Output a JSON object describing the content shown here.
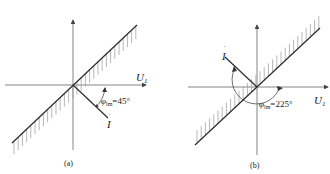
{
  "figures": [
    {
      "id": "a",
      "caption": "(a)",
      "axis_label": "U",
      "axis_label_sub": "1",
      "current_label": "I",
      "angle_symbol": "φ",
      "angle_sub": "lm",
      "angle_text": "=45°"
    },
    {
      "id": "b",
      "caption": "(b)",
      "axis_label": "U",
      "axis_label_sub": "1",
      "current_label": "I",
      "angle_symbol": "φ",
      "angle_sub": "lm",
      "angle_text": "=225°"
    }
  ],
  "colors": {
    "line": "#2a2a2a",
    "hatch": "#8a8a8a",
    "axis": "#555555"
  }
}
